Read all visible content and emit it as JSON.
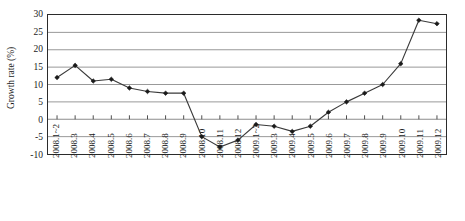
{
  "chart_data": {
    "type": "line",
    "title": "",
    "xlabel": "",
    "ylabel": "Growth rate (%)",
    "ylim": [
      -10,
      30
    ],
    "ytick_values": [
      30,
      25,
      20,
      15,
      10,
      5,
      0,
      -5,
      -10
    ],
    "ytick_labels": [
      "30",
      "25",
      "20",
      "15",
      "10",
      "5",
      "0",
      "-5",
      "-10"
    ],
    "grid": true,
    "grid_axis": "y",
    "legend": "none",
    "marker": "filled-diamond",
    "line_color": "#3a3a3a",
    "marker_color": "#1a1a1a",
    "grid_color": "#8c8c8c",
    "frame_color": "#2b2b2b",
    "categories": [
      "2008.1~2",
      "2008.3",
      "2008.4",
      "2008.5",
      "2008.6",
      "2008.7",
      "2008.8",
      "2008.9",
      "2008.10",
      "2008.11",
      "2008.12",
      "2009.1~2",
      "2009.3",
      "2009.4",
      "2009.5",
      "2009.6",
      "2009.7",
      "2009.8",
      "2009.9",
      "2009.10",
      "2009.11",
      "2009.12"
    ],
    "values": [
      12.0,
      15.5,
      11.0,
      11.5,
      9.0,
      8.0,
      7.5,
      7.5,
      -5.0,
      -8.0,
      -6.0,
      -1.5,
      -2.0,
      -3.5,
      -2.0,
      2.0,
      5.0,
      7.5,
      10.0,
      16.0,
      28.5,
      27.5
    ]
  }
}
